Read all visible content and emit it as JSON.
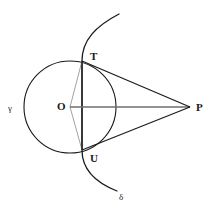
{
  "figure": {
    "type": "euclidean-geometry-diagram",
    "canvas": {
      "width": 212,
      "height": 213,
      "background": "#ffffff"
    },
    "stroke_color": "#1a1a1a",
    "faint_stroke_color": "#8a8a8a",
    "axis_stroke_color": "#6e6e6e"
  },
  "points": [
    {
      "id": "O",
      "label": "O",
      "x": 70,
      "y": 107,
      "label_x": 57,
      "label_y": 110,
      "role": "circle-center"
    },
    {
      "id": "T",
      "label": "T",
      "x": 82,
      "y": 61,
      "label_x": 90,
      "label_y": 60,
      "role": "intersection-upper"
    },
    {
      "id": "U",
      "label": "U",
      "x": 82,
      "y": 150,
      "label_x": 90,
      "label_y": 162,
      "role": "intersection-lower"
    },
    {
      "id": "P",
      "label": "P",
      "x": 190,
      "y": 107,
      "label_x": 196,
      "label_y": 111,
      "role": "external-apex"
    }
  ],
  "circle": {
    "id": "gamma",
    "label": "γ",
    "cx": 70,
    "cy": 107,
    "r": 46,
    "label_x": 8,
    "label_y": 111
  },
  "arc": {
    "id": "delta",
    "label": "δ",
    "label_x": 119,
    "label_y": 200,
    "path": "M 119 14 C 96 26 82 40 82 61 C 82 90 82 120 82 150 C 82 168 94 182 117 191",
    "start": {
      "x": 119,
      "y": 14
    },
    "end": {
      "x": 117,
      "y": 191
    }
  },
  "segments": [
    {
      "id": "OP",
      "from": "O",
      "to": "P",
      "style": "axis",
      "x1": 70,
      "y1": 107,
      "x2": 190,
      "y2": 107
    },
    {
      "id": "TP",
      "from": "T",
      "to": "P",
      "style": "solid",
      "x1": 82,
      "y1": 61,
      "x2": 190,
      "y2": 107
    },
    {
      "id": "UP",
      "from": "U",
      "to": "P",
      "style": "solid",
      "x1": 82,
      "y1": 150,
      "x2": 190,
      "y2": 107
    },
    {
      "id": "TU",
      "from": "T",
      "to": "U",
      "style": "solid",
      "x1": 82,
      "y1": 61,
      "x2": 82,
      "y2": 150
    },
    {
      "id": "OT",
      "from": "O",
      "to": "T",
      "style": "faint",
      "x1": 70,
      "y1": 107,
      "x2": 82,
      "y2": 61
    },
    {
      "id": "OU",
      "from": "O",
      "to": "U",
      "style": "faint",
      "x1": 70,
      "y1": 107,
      "x2": 82,
      "y2": 150
    }
  ]
}
